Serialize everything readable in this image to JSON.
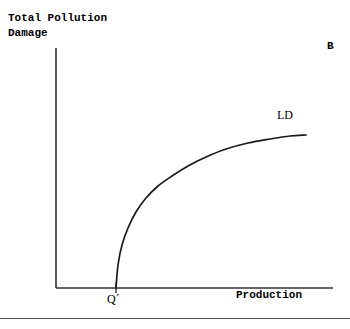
{
  "figure": {
    "y_axis_title": "Total Pollution\nDamage",
    "x_axis_title": "Production",
    "panel_label": "B",
    "curve_label": "LD",
    "x_tick_label": "Q´",
    "line_color": "#1a1a1a",
    "axis_color": "#333333",
    "rule_color": "#4a4a4a",
    "background": "#ffffff"
  },
  "chart_data": {
    "type": "line",
    "title": "",
    "xlabel": "Production",
    "ylabel": "Total Pollution Damage",
    "grid": false,
    "legend": "none",
    "annotations": [
      {
        "text": "B",
        "role": "panel-label",
        "x_px": 331,
        "y_px": 50
      },
      {
        "text": "LD",
        "role": "curve-label",
        "x_px": 287,
        "y_px": 116
      },
      {
        "text": "Q´",
        "role": "x-tick-label",
        "x_px": 113,
        "y_px": 298
      }
    ],
    "axes": {
      "origin_px": {
        "x": 56,
        "y": 288
      },
      "x_end_px": {
        "x": 333,
        "y": 288
      },
      "y_end_px": {
        "x": 56,
        "y": 48
      }
    },
    "ticks": {
      "x": [
        {
          "label": "Q´",
          "x_px": 116
        }
      ],
      "y": []
    },
    "series": [
      {
        "name": "LD",
        "description": "Total pollution damage rises from zero at Q´, steeply at first then with diminishing slope, approaching a plateau.",
        "points_px": [
          {
            "x": 116,
            "y": 288
          },
          {
            "x": 118,
            "y": 265
          },
          {
            "x": 122,
            "y": 245
          },
          {
            "x": 128,
            "y": 228
          },
          {
            "x": 136,
            "y": 212
          },
          {
            "x": 146,
            "y": 198
          },
          {
            "x": 158,
            "y": 186
          },
          {
            "x": 172,
            "y": 176
          },
          {
            "x": 188,
            "y": 166
          },
          {
            "x": 206,
            "y": 157
          },
          {
            "x": 226,
            "y": 149
          },
          {
            "x": 248,
            "y": 143
          },
          {
            "x": 270,
            "y": 139
          },
          {
            "x": 290,
            "y": 136
          },
          {
            "x": 306,
            "y": 135
          }
        ]
      }
    ]
  }
}
